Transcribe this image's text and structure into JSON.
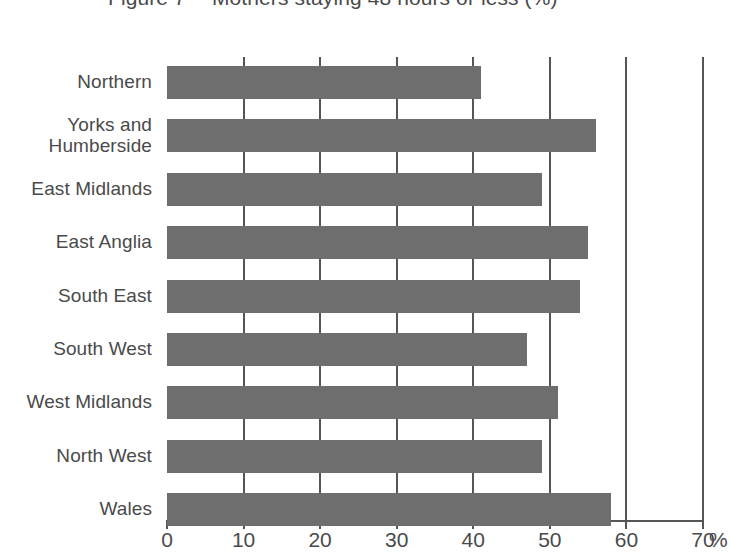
{
  "figure": {
    "number_label": "Figure 7",
    "title": "Mothers staying 48 hours or less (%)"
  },
  "axis": {
    "unit_symbol": "%",
    "tick_labels": [
      "0",
      "10",
      "20",
      "30",
      "40",
      "50",
      "60",
      "70"
    ]
  },
  "colors": {
    "bar_fill": "#6e6e6e",
    "gridline": "#555555",
    "text": "#4a4a4a",
    "background": "#ffffff"
  },
  "chart_data": {
    "type": "bar",
    "orientation": "horizontal",
    "title": "Figure 7  Mothers staying 48 hours or less (%)",
    "xlabel": "%",
    "ylabel": "",
    "xlim": [
      0,
      70
    ],
    "xticks": [
      0,
      10,
      20,
      30,
      40,
      50,
      60,
      70
    ],
    "grid": "vertical",
    "legend": "none",
    "categories": [
      "Northern",
      "Yorks and Humberside",
      "East Midlands",
      "East Anglia",
      "South East",
      "South West",
      "West Midlands",
      "North West",
      "Wales"
    ],
    "values": [
      41,
      56,
      49,
      55,
      54,
      47,
      51,
      49,
      58
    ]
  },
  "rows": [
    {
      "label_line1": "Northern",
      "label_line2": "",
      "value": 41
    },
    {
      "label_line1": "Yorks and",
      "label_line2": "Humberside",
      "value": 56
    },
    {
      "label_line1": "East Midlands",
      "label_line2": "",
      "value": 49
    },
    {
      "label_line1": "East Anglia",
      "label_line2": "",
      "value": 55
    },
    {
      "label_line1": "South East",
      "label_line2": "",
      "value": 54
    },
    {
      "label_line1": "South West",
      "label_line2": "",
      "value": 47
    },
    {
      "label_line1": "West Midlands",
      "label_line2": "",
      "value": 51
    },
    {
      "label_line1": "North West",
      "label_line2": "",
      "value": 49
    },
    {
      "label_line1": "Wales",
      "label_line2": "",
      "value": 58
    }
  ]
}
